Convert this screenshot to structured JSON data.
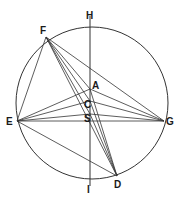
{
  "diagram": {
    "type": "geometric-construction",
    "stroke_color": "#333333",
    "background": "#ffffff",
    "circle": {
      "cx": 92,
      "cy": 103,
      "r": 76
    },
    "points": {
      "H": {
        "label": "H",
        "x": 90,
        "y": 22,
        "label_x": 86,
        "label_y": 19
      },
      "F": {
        "label": "F",
        "x": 46,
        "y": 37,
        "label_x": 40,
        "label_y": 34
      },
      "A": {
        "label": "A",
        "x": 90,
        "y": 89,
        "label_x": 92,
        "label_y": 89
      },
      "C": {
        "label": "C",
        "x": 90,
        "y": 101,
        "label_x": 84,
        "label_y": 108
      },
      "S": {
        "label": "S",
        "x": 90,
        "y": 114,
        "label_x": 84,
        "label_y": 122
      },
      "E": {
        "label": "E",
        "x": 17,
        "y": 121,
        "label_x": 6,
        "label_y": 125
      },
      "G": {
        "label": "G",
        "x": 164,
        "y": 121,
        "label_x": 166,
        "label_y": 125
      },
      "D": {
        "label": "D",
        "x": 117,
        "y": 176,
        "label_x": 114,
        "label_y": 188
      },
      "I": {
        "label": "I",
        "x": 90,
        "y": 182,
        "label_x": 87,
        "label_y": 193
      }
    },
    "segments": [
      [
        "H",
        "I"
      ],
      [
        "F",
        "E"
      ],
      [
        "F",
        "G"
      ],
      [
        "F",
        "A"
      ],
      [
        "F",
        "C"
      ],
      [
        "F",
        "S"
      ],
      [
        "F",
        "D"
      ],
      [
        "E",
        "A"
      ],
      [
        "E",
        "C"
      ],
      [
        "E",
        "S"
      ],
      [
        "E",
        "G"
      ],
      [
        "E",
        "D"
      ],
      [
        "G",
        "A"
      ],
      [
        "G",
        "C"
      ],
      [
        "G",
        "S"
      ],
      [
        "A",
        "D"
      ],
      [
        "C",
        "D"
      ],
      [
        "S",
        "D"
      ]
    ]
  }
}
